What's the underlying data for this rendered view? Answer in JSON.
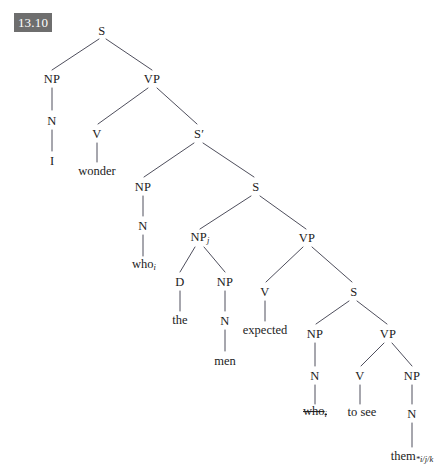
{
  "badge": {
    "label": "13.10",
    "bg_color": "#6e6e6e",
    "text_color": "#ffffff"
  },
  "diagram": {
    "type": "syntax-tree",
    "sentence": "I wonder who the men expected to see them",
    "line_color": "#3a3a4a",
    "text_color": "#1c1c1c",
    "background_color": "#ffffff"
  },
  "nodes": {
    "s_root": "S",
    "np_subject": "NP",
    "n_subject": "N",
    "word_i": "I",
    "vp_main": "VP",
    "v_wonder": "V",
    "word_wonder": "wonder",
    "sbar": "S",
    "sbar_prime": "′",
    "np_who": "NP",
    "n_who": "N",
    "word_who": "who",
    "word_who_sub": "i",
    "s_embedded": "S",
    "np_men": "NP",
    "np_men_sub": "j",
    "d_the": "D",
    "word_the": "the",
    "np_men_inner": "NP",
    "n_men": "N",
    "word_men": "men",
    "vp_expected": "VP",
    "v_expected": "V",
    "word_expected": "expected",
    "s_infinitive": "S",
    "np_trace": "NP",
    "n_trace": "N",
    "word_who_trace": "who",
    "word_who_trace_sub": "i",
    "vp_to_see": "VP",
    "v_to_see": "V",
    "word_to_see": "to see",
    "np_them": "NP",
    "n_them": "N",
    "word_them": "them",
    "word_them_sub": "*i/j/k"
  }
}
